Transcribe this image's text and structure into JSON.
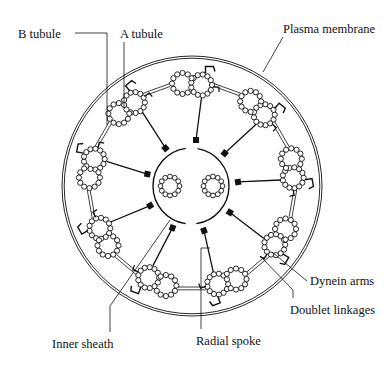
{
  "diagram": {
    "colors": {
      "stroke": "#111111",
      "background": "#ffffff"
    },
    "geometry": {
      "center": [
        192,
        186
      ],
      "membrane_radius": 130,
      "doublet_ring_radius": 101,
      "doublet_count": 9,
      "start_angle_deg": -90,
      "subunit_radius": 2.6,
      "tubule_radius": 10.5,
      "sheath_center": [
        191,
        186
      ],
      "sheath_radius": 38,
      "central_pair": [
        [
          170,
          186
        ],
        [
          213,
          186
        ]
      ],
      "central_tubule_radius": 9.5
    },
    "labels": [
      {
        "id": "b-tubule",
        "text": "B tubule",
        "x": 18,
        "y": 28,
        "leader": [
          [
            75,
            33
          ],
          [
            107,
            33
          ],
          [
            107,
            125
          ]
        ]
      },
      {
        "id": "a-tubule",
        "text": "A tubule",
        "x": 120,
        "y": 28,
        "leader": [
          [
            124,
            42
          ],
          [
            124,
            108
          ]
        ]
      },
      {
        "id": "plasma-membrane",
        "text": "Plasma membrane",
        "x": 283,
        "y": 23,
        "leader": [
          [
            283,
            37
          ],
          [
            263,
            72
          ]
        ]
      },
      {
        "id": "dynein-arms",
        "text": "Dynein arms",
        "x": 310,
        "y": 275,
        "leader": [
          [
            307,
            281
          ],
          [
            272,
            252
          ]
        ]
      },
      {
        "id": "doublet-linkages",
        "text": "Doublet linkages",
        "x": 290,
        "y": 304,
        "leader": [
          [
            293,
            298
          ],
          [
            293,
            290
          ],
          [
            260,
            256
          ]
        ]
      },
      {
        "id": "inner-sheath",
        "text": "Inner sheath",
        "x": 52,
        "y": 338,
        "leader": [
          [
            110,
            332
          ],
          [
            110,
            306
          ],
          [
            170,
            220
          ]
        ]
      },
      {
        "id": "radial-spoke",
        "text": "Radial spoke",
        "x": 196,
        "y": 335,
        "leader": [
          [
            201,
            329
          ],
          [
            201,
            248
          ],
          [
            210,
            248
          ]
        ]
      }
    ]
  }
}
